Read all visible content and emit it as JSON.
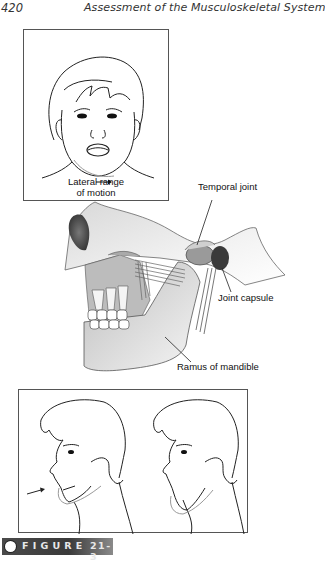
{
  "header": {
    "page_number": "420",
    "running_title": "Assessment of the Musculoskeletal System"
  },
  "figure_top_inset": {
    "caption_line1": "Lateral range",
    "caption_line2": "of motion",
    "icon": "arrow-right-icon"
  },
  "anatomy_labels": {
    "temporal_joint": "Temporal joint",
    "joint_capsule": "Joint capsule",
    "ramus": "Ramus of mandible"
  },
  "figure_bottom_inset": {
    "icon": "arrow-right-icon"
  },
  "figure_caption": {
    "label": "FIGURE",
    "number": "21-3"
  }
}
